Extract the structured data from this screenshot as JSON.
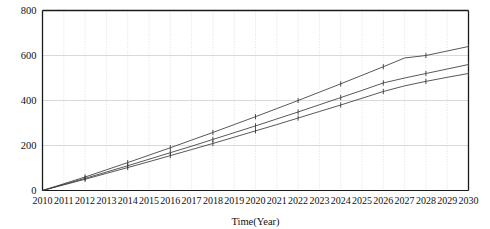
{
  "chart_data": {
    "type": "line",
    "title": "",
    "xlabel": "Time(Year)",
    "ylabel": "",
    "xlim": [
      2010,
      2030
    ],
    "ylim": [
      0,
      800
    ],
    "grid": true,
    "legend_position": "none",
    "x": [
      2010,
      2011,
      2012,
      2013,
      2014,
      2015,
      2016,
      2017,
      2018,
      2019,
      2020,
      2021,
      2022,
      2023,
      2024,
      2025,
      2026,
      2027,
      2028,
      2029,
      2030
    ],
    "xticklabels": [
      "2010",
      "2011",
      "2012",
      "2013",
      "2014",
      "2015",
      "2016",
      "2017",
      "2018",
      "2019",
      "2020",
      "2021",
      "2022",
      "2023",
      "2024",
      "2025",
      "2026",
      "2027",
      "2028",
      "2029",
      "2030"
    ],
    "yticks": [
      0,
      200,
      400,
      600,
      800
    ],
    "yticklabels": [
      "0",
      "200",
      "400",
      "600",
      "800"
    ],
    "marker_interval_years": 2,
    "series": [
      {
        "name": "series-1",
        "color": "#3a3a3a",
        "values": [
          0,
          30,
          60,
          92,
          124,
          157,
          190,
          224,
          258,
          293,
          328,
          364,
          400,
          437,
          474,
          512,
          550,
          589,
          600,
          620,
          640
        ]
      },
      {
        "name": "series-2",
        "color": "#3a3a3a",
        "values": [
          0,
          27,
          54,
          82,
          110,
          139,
          168,
          197,
          227,
          257,
          287,
          318,
          349,
          381,
          413,
          445,
          478,
          500,
          520,
          540,
          560
        ]
      },
      {
        "name": "series-3",
        "color": "#3a3a3a",
        "values": [
          0,
          25,
          50,
          76,
          102,
          128,
          155,
          182,
          209,
          237,
          265,
          293,
          322,
          351,
          380,
          410,
          440,
          465,
          485,
          503,
          520
        ]
      }
    ]
  },
  "colors": {
    "line": "#3a3a3a",
    "frame": "#1a1a1a",
    "grid_horizontal": "#cfcfcf",
    "grid_vertical": "#d8d8d8",
    "background": "#ffffff",
    "text": "#111111"
  }
}
